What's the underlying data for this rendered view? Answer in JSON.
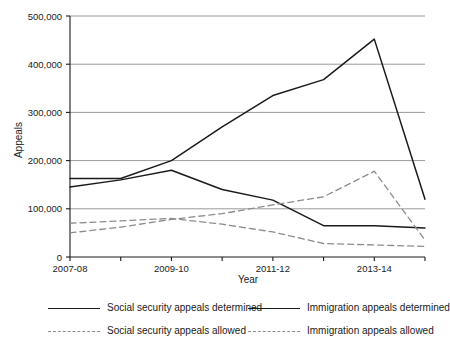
{
  "chart_data": {
    "type": "line",
    "title": "",
    "xlabel": "Year",
    "ylabel": "Appeals",
    "ylim": [
      0,
      500000
    ],
    "ytick_labels": [
      "0",
      "100,000",
      "200,000",
      "300,000",
      "400,000",
      "500,000"
    ],
    "ytick_values": [
      0,
      100000,
      200000,
      300000,
      400000,
      500000
    ],
    "grid": true,
    "grid_axis": "y",
    "legend_position": "below",
    "x": [
      "2007-08",
      "2008-09",
      "2009-10",
      "2010-11",
      "2011-12",
      "2012-13",
      "2013-14",
      "2014-15"
    ],
    "xtick_labels": [
      "2007-08",
      "",
      "2009-10",
      "",
      "2011-12",
      "",
      "2013-14",
      ""
    ],
    "categories": [
      "2007-08",
      "2008-09",
      "2009-10",
      "2010-11",
      "2011-12",
      "2012-13",
      "2013-14",
      "2014-15"
    ],
    "series": [
      {
        "name": "Social security appeals determined",
        "style": "solid",
        "color": "#1a1a1a",
        "values": [
          145000,
          160000,
          180000,
          140000,
          118000,
          65000,
          65000,
          60000
        ]
      },
      {
        "name": "Immigration appeals determined",
        "style": "solid",
        "color": "#1a1a1a",
        "values": [
          163000,
          163000,
          200000,
          270000,
          335000,
          368000,
          452000,
          120000
        ]
      },
      {
        "name": "Social security appeals allowed",
        "style": "dashed",
        "color": "#8d8d8d",
        "values": [
          50000,
          62000,
          78000,
          90000,
          108000,
          125000,
          178000,
          35000
        ]
      },
      {
        "name": "Immigration appeals allowed",
        "style": "dashed",
        "color": "#8d8d8d",
        "values": [
          70000,
          75000,
          80000,
          68000,
          52000,
          28000,
          25000,
          22000
        ]
      }
    ]
  },
  "legend": {
    "items": [
      {
        "label": "Social security appeals determined",
        "style": "solid"
      },
      {
        "label": "Immigration appeals determined",
        "style": "solid"
      },
      {
        "label": "Social security appeals allowed",
        "style": "dashed"
      },
      {
        "label": "Immigration appeals allowed",
        "style": "dashed"
      }
    ]
  },
  "colors": {
    "determined": "#1a1a1a",
    "allowed": "#8d8d8d",
    "grid": "#9a9a9a",
    "axis": "#1a1a1a",
    "background": "#ffffff"
  }
}
